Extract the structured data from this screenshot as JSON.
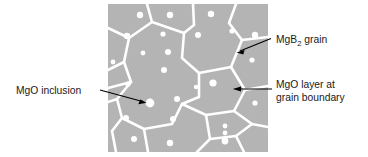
{
  "figure": {
    "panel": {
      "name": "microstructure-panel",
      "x": 108,
      "y": 4,
      "width": 160,
      "height": 148,
      "grain_color": "#b4b4b4",
      "boundary_color": "#ffffff",
      "inclusion_color": "#ffffff"
    },
    "annotations": [
      {
        "id": "mgb2-grain",
        "line1": "MgB",
        "subscript": "2",
        "line1_tail": " grain",
        "text_x": 276,
        "text_y": 43,
        "leader": {
          "x1": 271,
          "y1": 38,
          "x2": 237,
          "y2": 52
        },
        "arrow_at": "grain-interior"
      },
      {
        "id": "mgo-layer",
        "line1": "MgO layer at",
        "line2": "grain boundary",
        "text_x": 276,
        "text_y": 88,
        "text_y2": 101,
        "leader": {
          "x1": 272,
          "y1": 89,
          "x2": 233,
          "y2": 89
        },
        "arrow_at": "grain-boundary"
      },
      {
        "id": "mgo-inclusion",
        "line1": "MgO inclusion",
        "text_x": 16,
        "text_y": 94,
        "leader": {
          "x1": 100,
          "y1": 90,
          "x2": 146,
          "y2": 103
        },
        "arrow_at": "inclusion-dot"
      }
    ],
    "boundary_paths": [
      "M 108 70 L 124 62 L 129 38 L 152 22 L 147 4",
      "M 129 38 L 108 28",
      "M 152 22 L 184 33 L 194 25 L 193 4",
      "M 184 33 L 182 58 L 199 73 L 231 67 L 242 40 L 229 23 L 236 4",
      "M 242 40 L 268 37",
      "M 124 62 L 131 82 L 117 99 L 122 118 L 112 131 L 116 152",
      "M 131 82 L 108 88",
      "M 117 99 L 108 102",
      "M 122 118 L 144 129 L 148 152",
      "M 144 129 L 172 124 L 182 104 L 199 97 L 199 73",
      "M 182 104 L 206 115 L 210 139 L 197 152",
      "M 206 115 L 234 111 L 245 90 L 231 67",
      "M 245 90 L 268 86",
      "M 210 139 L 236 136 L 244 152",
      "M 236 136 L 252 124 L 268 127",
      "M 234 111 L 252 124"
    ],
    "inclusions": [
      {
        "cx": 140,
        "cy": 15,
        "r": 3.2
      },
      {
        "cx": 170,
        "cy": 15,
        "r": 3.2
      },
      {
        "cx": 211,
        "cy": 14,
        "r": 3.2
      },
      {
        "cx": 232,
        "cy": 31,
        "r": 2.6
      },
      {
        "cx": 127,
        "cy": 36,
        "r": 3.2
      },
      {
        "cx": 163,
        "cy": 34,
        "r": 2.6
      },
      {
        "cx": 198,
        "cy": 35,
        "r": 3.0
      },
      {
        "cx": 255,
        "cy": 35,
        "r": 3.2
      },
      {
        "cx": 168,
        "cy": 52,
        "r": 3.0
      },
      {
        "cx": 143,
        "cy": 53,
        "r": 2.4
      },
      {
        "cx": 252,
        "cy": 60,
        "r": 2.6
      },
      {
        "cx": 164,
        "cy": 70,
        "r": 3.0
      },
      {
        "cx": 213,
        "cy": 83,
        "r": 3.6
      },
      {
        "cx": 128,
        "cy": 84,
        "r": 2.6
      },
      {
        "cx": 150,
        "cy": 103,
        "r": 4.4
      },
      {
        "cx": 177,
        "cy": 99,
        "r": 3.0
      },
      {
        "cx": 255,
        "cy": 103,
        "r": 2.6
      },
      {
        "cx": 126,
        "cy": 118,
        "r": 3.0
      },
      {
        "cx": 173,
        "cy": 119,
        "r": 3.0
      },
      {
        "cx": 225,
        "cy": 126,
        "r": 2.4
      },
      {
        "cx": 225,
        "cy": 133,
        "r": 2.4
      },
      {
        "cx": 134,
        "cy": 139,
        "r": 3.0
      },
      {
        "cx": 170,
        "cy": 143,
        "r": 3.2
      },
      {
        "cx": 225,
        "cy": 141,
        "r": 3.4
      },
      {
        "cx": 196,
        "cy": 87,
        "r": 2.2
      },
      {
        "cx": 113,
        "cy": 62,
        "r": 2.4
      }
    ]
  }
}
